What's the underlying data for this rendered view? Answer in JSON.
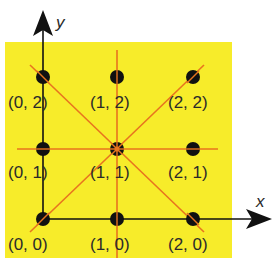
{
  "diagram": {
    "background_color": "#f7ec2a",
    "line_color": "#e8741e",
    "axis_color": "#111111",
    "axes": {
      "x_label": "x",
      "y_label": "y"
    },
    "points": [
      {
        "label": "(0, 2)",
        "x": 0,
        "y": 2
      },
      {
        "label": "(1, 2)",
        "x": 1,
        "y": 2
      },
      {
        "label": "(2, 2)",
        "x": 2,
        "y": 2
      },
      {
        "label": "(0, 1)",
        "x": 0,
        "y": 1
      },
      {
        "label": "(1, 1)",
        "x": 1,
        "y": 1
      },
      {
        "label": "(2, 1)",
        "x": 2,
        "y": 1
      },
      {
        "label": "(0, 0)",
        "x": 0,
        "y": 0
      },
      {
        "label": "(1, 0)",
        "x": 1,
        "y": 0
      },
      {
        "label": "(2, 0)",
        "x": 2,
        "y": 0
      }
    ],
    "center_point": "(1, 1)",
    "symmetry_lines": [
      "vertical x=1",
      "horizontal y=1",
      "diagonal y=x",
      "anti-diagonal y=2-x"
    ]
  }
}
